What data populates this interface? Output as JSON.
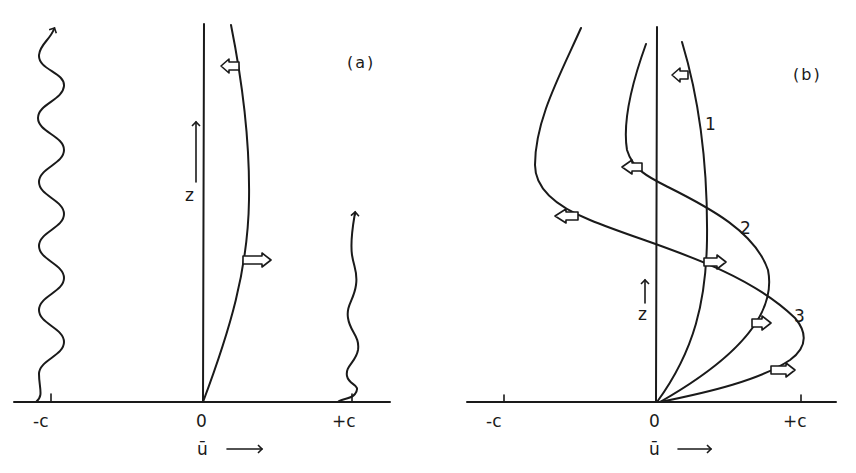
{
  "figure": {
    "panels": [
      {
        "id": "a",
        "label": "(a)",
        "axis": {
          "xlabel": "ū",
          "ylabel": "z",
          "ticks": [
            "-c",
            "0",
            "+c"
          ]
        },
        "elements": [
          "wavy-line-at-minus-c",
          "velocity-profile",
          "wavy-line-at-plus-c",
          "hollow-arrow-left-upper",
          "hollow-arrow-right-lower"
        ]
      },
      {
        "id": "b",
        "label": "(b)",
        "axis": {
          "xlabel": "ū",
          "ylabel": "z",
          "ticks": [
            "-c",
            "0",
            "+c"
          ]
        },
        "curves": [
          {
            "label": "1"
          },
          {
            "label": "2"
          },
          {
            "label": "3"
          }
        ]
      }
    ]
  },
  "text": {
    "a_label": "(a)",
    "b_label": "(b)",
    "minus_c": "-c",
    "zero": "0",
    "plus_c": "+c",
    "ubar": "ū",
    "z": "z",
    "curve1": "1",
    "curve2": "2",
    "curve3": "3"
  },
  "colors": {
    "ink": "#1a1a1a",
    "background": "#ffffff"
  }
}
